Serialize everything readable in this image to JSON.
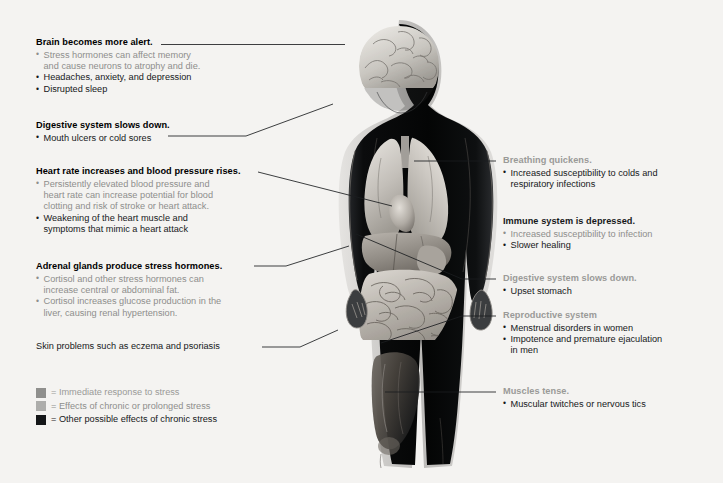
{
  "diagram": {
    "background_color": "#f4f3f1",
    "line_color": "#1b1d20"
  },
  "legend": {
    "items": [
      {
        "swatch_color": "#8f8f8d",
        "label": "= Immediate response to stress",
        "tone": "tone-immediate"
      },
      {
        "swatch_color": "#adadab",
        "label": "= Effects of chronic or prolonged stress",
        "tone": "tone-chronic"
      },
      {
        "swatch_color": "#141618",
        "label": "= Other possible effects of chronic stress",
        "tone": "tone-other"
      }
    ]
  },
  "callouts_left": [
    {
      "heading": "Brain becomes more alert.",
      "heading_tone": "tone-other",
      "items": [
        {
          "text": "Stress hormones can affect memory",
          "tone": "tone-chronic",
          "bullet": true
        },
        {
          "text": "and cause neurons to atrophy and die.",
          "tone": "tone-chronic",
          "bullet": false
        },
        {
          "text": "Headaches, anxiety, and depression",
          "tone": "tone-other",
          "bullet": true
        },
        {
          "text": "Disrupted sleep",
          "tone": "tone-other",
          "bullet": true
        }
      ]
    },
    {
      "heading": "Digestive system slows down.",
      "heading_tone": "tone-other",
      "items": [
        {
          "text": "Mouth ulcers or cold sores",
          "tone": "tone-other",
          "bullet": true
        }
      ]
    },
    {
      "heading": "Heart rate increases and blood pressure rises.",
      "heading_tone": "tone-other",
      "items": [
        {
          "text": "Persistently elevated blood pressure and",
          "tone": "tone-chronic",
          "bullet": true
        },
        {
          "text": "heart rate can increase potential for blood",
          "tone": "tone-chronic",
          "bullet": false
        },
        {
          "text": "clotting and risk of stroke or heart attack.",
          "tone": "tone-chronic",
          "bullet": false
        },
        {
          "text": "Weakening of the heart muscle and",
          "tone": "tone-other",
          "bullet": true
        },
        {
          "text": "symptoms that mimic a heart attack",
          "tone": "tone-other",
          "bullet": false
        }
      ]
    },
    {
      "heading": "Adrenal glands produce stress hormones.",
      "heading_tone": "tone-other",
      "items": [
        {
          "text": "Cortisol and other stress hormones can",
          "tone": "tone-chronic",
          "bullet": true
        },
        {
          "text": "increase central or abdominal fat.",
          "tone": "tone-chronic",
          "bullet": false
        },
        {
          "text": "Cortisol increases glucose production in the",
          "tone": "tone-chronic",
          "bullet": true
        },
        {
          "text": "liver, causing renal hypertension.",
          "tone": "tone-chronic",
          "bullet": false
        }
      ]
    }
  ],
  "skin_note": "Skin problems such as eczema and psoriasis",
  "callouts_right": [
    {
      "heading": "Breathing quickens.",
      "heading_tone": "tone-immediate",
      "items": [
        {
          "text": "Increased susceptibility to colds and",
          "tone": "tone-other",
          "bullet": true
        },
        {
          "text": "respiratory infections",
          "tone": "tone-other",
          "bullet": false
        }
      ]
    },
    {
      "heading": "Immune system is depressed.",
      "heading_tone": "tone-other",
      "items": [
        {
          "text": "Increased susceptibility to infection",
          "tone": "tone-chronic",
          "bullet": true
        },
        {
          "text": "Slower healing",
          "tone": "tone-other",
          "bullet": true
        }
      ]
    },
    {
      "heading": "Digestive system slows down.",
      "heading_tone": "tone-immediate",
      "items": [
        {
          "text": "Upset stomach",
          "tone": "tone-other",
          "bullet": true
        }
      ]
    },
    {
      "heading": "Reproductive system",
      "heading_tone": "tone-immediate",
      "items": [
        {
          "text": "Menstrual disorders in women",
          "tone": "tone-other",
          "bullet": true
        },
        {
          "text": "Impotence and premature ejaculation",
          "tone": "tone-other",
          "bullet": true
        },
        {
          "text": "in men",
          "tone": "tone-other",
          "bullet": false
        }
      ]
    },
    {
      "heading": "Muscles tense.",
      "heading_tone": "tone-immediate",
      "items": [
        {
          "text": "Muscular twitches or nervous tics",
          "tone": "tone-other",
          "bullet": true
        }
      ]
    }
  ],
  "anatomy": {
    "description": "Grayscale anatomical illustration of a standing human figure in dark silhouette with internal organs visible",
    "parts": [
      "brain",
      "lungs",
      "heart",
      "liver",
      "stomach",
      "intestines",
      "pelvis",
      "thigh-muscles",
      "hands"
    ]
  }
}
